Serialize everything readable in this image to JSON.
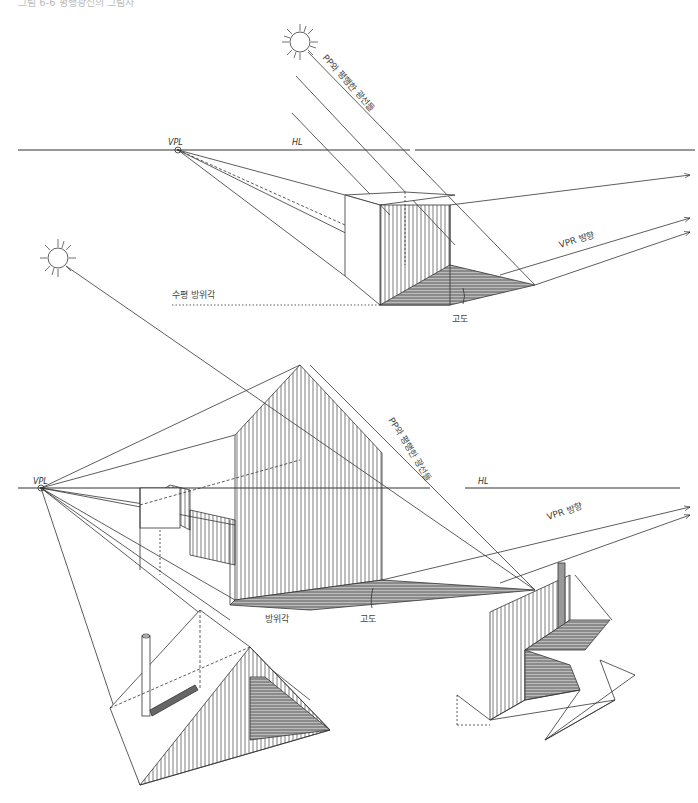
{
  "figure": {
    "top_caption": "그림 6-6 평행광선의 그림자",
    "diagram_top": {
      "horizon_label": "HL",
      "vanishing_point_label": "VPL",
      "sun_rays_label": "PP와 평행한 광선들",
      "vpr_direction_label": "VPR 방향",
      "horizontal_azimuth_label": "수평 방위각",
      "altitude_label": "고도"
    },
    "diagram_bottom": {
      "horizon_label": "HL",
      "vanishing_point_label": "VPL",
      "sun_rays_label": "PP와 평행한 광선들",
      "vpr_direction_label": "VPR 방향",
      "azimuth_label": "방위각",
      "altitude_label": "고도"
    },
    "colors": {
      "ink": "#333333",
      "shadow_hatch": "#555555",
      "background": "#ffffff"
    }
  }
}
